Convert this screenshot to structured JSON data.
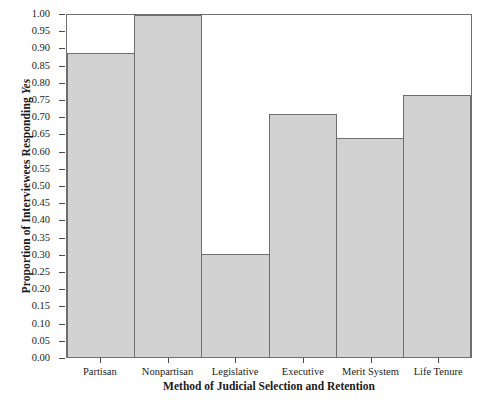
{
  "chart_data": {
    "type": "bar",
    "title": "",
    "categories": [
      "Partisan",
      "Nonpartisan",
      "Legislative",
      "Executive",
      "Merit System",
      "Life Tenure"
    ],
    "values": [
      0.89,
      1.0,
      0.3,
      0.71,
      0.64,
      0.765
    ],
    "xlabel": "Method of Judicial Selection and Retention",
    "ylabel_plain": "Proportion of Interviewees Responding ",
    "ylabel_italic": "Yes",
    "ylim": [
      0.0,
      1.0
    ],
    "ytick_labels": [
      "1.00",
      "0.95",
      "0.90",
      "0.85",
      "0.80",
      "0.75",
      "0.70",
      "0.65",
      "0.60",
      "0.55",
      "0.50",
      "0.45",
      "0.40",
      "0.35",
      "0.30",
      "0.25",
      "0.20",
      "0.15",
      "0.10",
      "0.05",
      "0.00"
    ],
    "ytick_values": [
      1.0,
      0.95,
      0.9,
      0.85,
      0.8,
      0.75,
      0.7,
      0.65,
      0.6,
      0.55,
      0.5,
      0.45,
      0.4,
      0.35,
      0.3,
      0.25,
      0.2,
      0.15,
      0.1,
      0.05,
      0.0
    ],
    "grid": false,
    "legend": false,
    "bar_fill_color": "#d2d2d2",
    "bar_edge_color": "#6e6e6e",
    "axis_color": "#4a4a4a",
    "background_color": "#ffffff"
  }
}
